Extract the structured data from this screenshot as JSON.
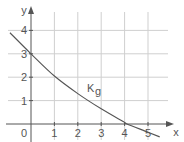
{
  "chart_data": {
    "type": "line",
    "title": "",
    "xlabel": "x",
    "ylabel": "y",
    "xlim": [
      -1.3,
      5.7
    ],
    "ylim": [
      -0.7,
      4.5
    ],
    "x_ticks": [
      "0",
      "1",
      "2",
      "3",
      "4",
      "5"
    ],
    "y_ticks": [
      "1",
      "2",
      "3",
      "4"
    ],
    "grid": true,
    "series": [
      {
        "name": "K_g",
        "label": "K",
        "subscript": "g",
        "x": [
          -0.9,
          0,
          1,
          2,
          3,
          4,
          4.1,
          5,
          5.5
        ],
        "y": [
          3.9,
          3.0,
          2.05,
          1.3,
          0.65,
          0.07,
          0,
          -0.35,
          -0.55
        ]
      }
    ]
  },
  "colors": {
    "grid": "#cfcfcf",
    "axis": "#555555",
    "curve": "#555555",
    "text": "#555555"
  }
}
